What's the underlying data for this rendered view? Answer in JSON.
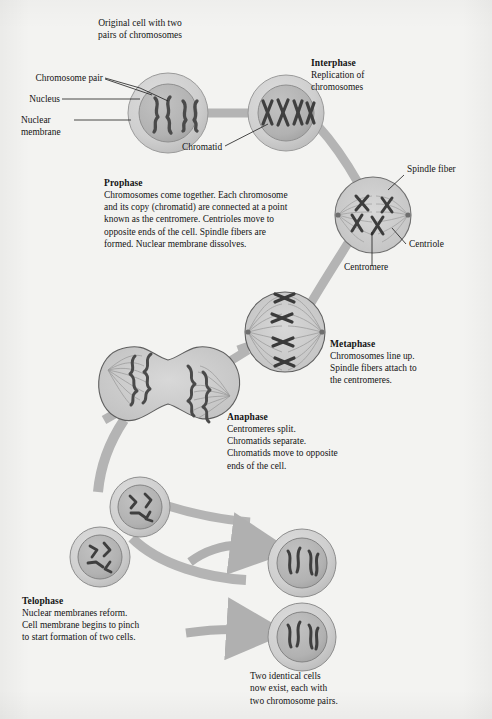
{
  "diagram": {
    "background_color": "#f3f3f1",
    "ribbon_color": "#b3b3b3",
    "cell_membrane_color": "#c9c9c9",
    "nucleus_color": "#b0b0b0",
    "chromosome_color": "#4a4a4a",
    "text_color": "#141414"
  },
  "header": {
    "line1": "Original cell with two",
    "line2": "pairs of chromosomes"
  },
  "labels": {
    "chromosome_pair": "Chromosome pair",
    "nucleus": "Nucleus",
    "nuclear_membrane_line1": "Nuclear",
    "nuclear_membrane_line2": "membrane",
    "chromatid": "Chromatid",
    "spindle_fiber": "Spindle fiber",
    "centriole": "Centriole",
    "centromere": "Centromere"
  },
  "phases": {
    "interphase": {
      "title": "Interphase",
      "body_line1": "Replication of",
      "body_line2": "chromosomes"
    },
    "prophase": {
      "title": "Prophase",
      "body_line1": "Chromosomes come together. Each chromosome",
      "body_line2": "and its copy (chromatid) are connected at a point",
      "body_line3": "known as the centromere. Centrioles move to",
      "body_line4": "opposite ends of the cell. Spindle fibers are",
      "body_line5": "formed. Nuclear membrane dissolves."
    },
    "metaphase": {
      "title": "Metaphase",
      "body_line1": "Chromosomes line up.",
      "body_line2": "Spindle fibers attach to",
      "body_line3": "the centromeres."
    },
    "anaphase": {
      "title": "Anaphase",
      "body_line1": "Centromeres split.",
      "body_line2": "Chromatids separate.",
      "body_line3": "Chromatids move to opposite",
      "body_line4": "ends of the cell."
    },
    "telophase": {
      "title": "Telophase",
      "body_line1": "Nuclear membranes reform.",
      "body_line2": "Cell membrane begins to pinch",
      "body_line3": "to start formation of two cells."
    }
  },
  "footer": {
    "line1": "Two identical cells",
    "line2": "now exist, each with",
    "line3": "two chromosome pairs."
  },
  "cells": [
    {
      "id": "original-cell",
      "cx": 168,
      "cy": 113,
      "r_outer": 40,
      "r_inner": 29,
      "stage": "original"
    },
    {
      "id": "interphase-cell",
      "cx": 286,
      "cy": 113,
      "r_outer": 38,
      "r_inner": 28,
      "stage": "interphase"
    },
    {
      "id": "prophase-cell",
      "cx": 373,
      "cy": 215,
      "r_outer": 38,
      "r_inner": 0,
      "stage": "prophase"
    },
    {
      "id": "metaphase-cell",
      "cx": 285,
      "cy": 332,
      "r_outer": 40,
      "r_inner": 0,
      "stage": "metaphase"
    },
    {
      "id": "anaphase-cell",
      "cx": 168,
      "cy": 385,
      "r_outer": 0,
      "r_inner": 0,
      "stage": "anaphase"
    },
    {
      "id": "telophase-cell-a",
      "cx": 140,
      "cy": 507,
      "r_outer": 30,
      "r_inner": 22,
      "stage": "telophase"
    },
    {
      "id": "telophase-cell-b",
      "cx": 100,
      "cy": 557,
      "r_outer": 30,
      "r_inner": 22,
      "stage": "telophase"
    },
    {
      "id": "daughter-cell-1",
      "cx": 302,
      "cy": 563,
      "r_outer": 34,
      "r_inner": 25,
      "stage": "daughter"
    },
    {
      "id": "daughter-cell-2",
      "cx": 302,
      "cy": 637,
      "r_outer": 34,
      "r_inner": 25,
      "stage": "daughter"
    }
  ]
}
